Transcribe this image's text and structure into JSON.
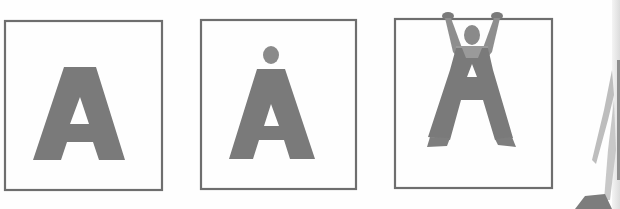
{
  "illustration": {
    "description": "Three-panel sequence: letter A transforming into a person hanging from a bar",
    "panels": [
      {
        "id": "panel-1",
        "subject": "plain letter A"
      },
      {
        "id": "panel-2",
        "subject": "letter A with head"
      },
      {
        "id": "panel-3",
        "subject": "letter A figure with arms hanging from frame"
      }
    ],
    "colors": {
      "figure": "#7a7a7a",
      "frame": "#6e6e6e",
      "background": "#fefefe",
      "skin": "#8a8a8a"
    }
  }
}
